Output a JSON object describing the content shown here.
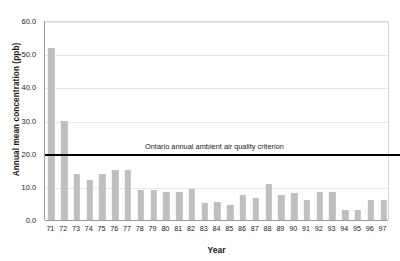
{
  "chart_data": {
    "type": "bar",
    "title": "",
    "xlabel": "Year",
    "ylabel": "Annual mean concentration (ppb)",
    "ylim": [
      0,
      60
    ],
    "ytick_labels": [
      "0.0",
      "10.0",
      "20.0",
      "30.0",
      "40.0",
      "50.0",
      "60.0"
    ],
    "ytick_values": [
      0,
      10,
      20,
      30,
      40,
      50,
      60
    ],
    "grid": true,
    "legend": "none",
    "bar_color": "#bfbfbf",
    "categories": [
      "71",
      "72",
      "73",
      "74",
      "75",
      "76",
      "77",
      "78",
      "79",
      "80",
      "81",
      "82",
      "83",
      "84",
      "85",
      "86",
      "87",
      "88",
      "89",
      "90",
      "91",
      "92",
      "93",
      "94",
      "95",
      "96",
      "97"
    ],
    "values": [
      52.0,
      30.0,
      14.0,
      12.0,
      14.0,
      15.0,
      15.0,
      9.0,
      9.0,
      8.5,
      8.5,
      9.5,
      5.0,
      5.5,
      4.5,
      7.5,
      6.5,
      11.0,
      7.5,
      8.0,
      6.0,
      8.5,
      8.5,
      3.0,
      3.0,
      6.0,
      6.0
    ],
    "annotations": [
      {
        "name": "criterion-line",
        "text": "Ontario annual ambient air quality criterion",
        "value": 20.0,
        "color": "#000000"
      }
    ]
  }
}
